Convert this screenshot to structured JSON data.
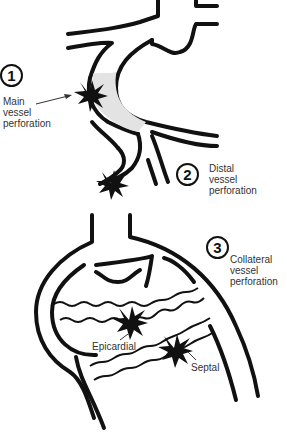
{
  "diagram": {
    "type": "coronary perforation classification",
    "items": [
      {
        "number": "1",
        "label_lines": [
          "Main",
          "vessel",
          "perforation"
        ]
      },
      {
        "number": "2",
        "label_lines": [
          "Distal",
          "vessel",
          "perforation"
        ]
      },
      {
        "number": "3",
        "label_lines": [
          "Collateral",
          "vessel",
          "perforation"
        ]
      }
    ],
    "sublabels": {
      "epicardial": "Epicardial",
      "septal": "Septal"
    },
    "colors": {
      "stroke": "#111111",
      "fill_shaded": "#e3e3e3",
      "background": "#ffffff"
    }
  }
}
